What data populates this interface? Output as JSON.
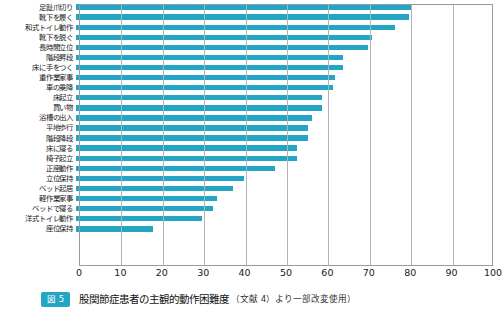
{
  "figure": {
    "badge_label": "図 5",
    "caption_title": "股関節症患者の主観的動作困難度",
    "caption_source": "（文献 4）より一部改変使用）"
  },
  "chart_data": {
    "type": "bar",
    "orientation": "horizontal",
    "title": "股関節症患者の主観的動作困難度",
    "xlabel": "",
    "ylabel": "",
    "xlim": [
      0,
      100
    ],
    "ylim": null,
    "grid": true,
    "legend": null,
    "bar_color": "#24a5c4",
    "xticks": [
      0,
      10,
      20,
      30,
      40,
      50,
      60,
      70,
      80,
      90,
      100
    ],
    "xtick_labels": [
      "0",
      "10",
      "20",
      "30",
      "40",
      "50",
      "60",
      "70",
      "80",
      "90",
      "100"
    ],
    "categories": [
      "足趾爪切り",
      "靴下を履く",
      "和式トイレ動作",
      "靴下を脱ぐ",
      "長時間立位",
      "階段昇段",
      "床に手をつく",
      "重作業家事",
      "車の乗降",
      "床起立",
      "買い物",
      "浴槽の出入",
      "平地歩行",
      "階段降段",
      "床に寝る",
      "椅子起立",
      "正座動作",
      "立位保持",
      "ベッド起居",
      "軽作業家事",
      "ベッドで寝る",
      "洋式トイレ動作",
      "座位保持"
    ],
    "values": [
      81.0,
      80.5,
      77.0,
      71.5,
      70.5,
      64.5,
      64.5,
      62.5,
      62.0,
      59.5,
      59.5,
      57.0,
      56.0,
      56.0,
      53.5,
      53.5,
      48.0,
      40.5,
      38.0,
      34.0,
      33.0,
      30.5,
      18.5
    ]
  }
}
